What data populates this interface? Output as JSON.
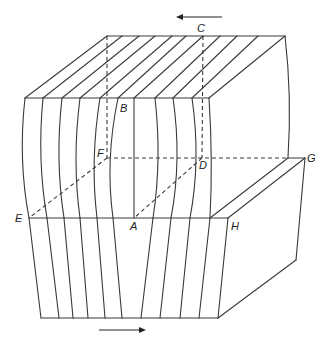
{
  "figure": {
    "type": "block-diagram-shear",
    "labels": [
      {
        "id": "A",
        "text": "A",
        "x": 130,
        "y": 230
      },
      {
        "id": "B",
        "text": "B",
        "x": 120,
        "y": 112
      },
      {
        "id": "C",
        "text": "C",
        "x": 197,
        "y": 32
      },
      {
        "id": "D",
        "text": "D",
        "x": 199,
        "y": 169
      },
      {
        "id": "E",
        "text": "E",
        "x": 15,
        "y": 222
      },
      {
        "id": "F",
        "text": "F",
        "x": 97,
        "y": 157
      },
      {
        "id": "G",
        "text": "G",
        "x": 307,
        "y": 162
      },
      {
        "id": "H",
        "text": "H",
        "x": 231,
        "y": 230
      }
    ],
    "arrows": [
      {
        "name": "top-shear-arrow",
        "direction": "left",
        "x1": 222,
        "y1": 17,
        "x2": 176,
        "y2": 17
      },
      {
        "name": "bottom-shear-arrow",
        "direction": "right",
        "x1": 99,
        "y1": 330,
        "x2": 146,
        "y2": 330
      }
    ],
    "top_face": {
      "back_edge": {
        "x1": 107,
        "y1": 36,
        "x2": 285,
        "y2": 36
      },
      "front_edge": {
        "x1": 25,
        "y1": 98,
        "x2": 209,
        "y2": 98
      },
      "stripe_back_x": [
        107,
        122,
        139,
        155,
        172,
        186,
        220,
        237,
        258
      ],
      "stripe_front_x": [
        25,
        43,
        62,
        80,
        100,
        118,
        155,
        173,
        192
      ]
    },
    "front_upper_verticals": [
      {
        "top": [
          25,
          98
        ],
        "mid": [
          22,
          160
        ],
        "bottom": [
          29,
          218
        ]
      },
      {
        "top": [
          43,
          98
        ],
        "mid": [
          41,
          160
        ],
        "bottom": [
          47,
          218
        ]
      },
      {
        "top": [
          62,
          98
        ],
        "mid": [
          59,
          160
        ],
        "bottom": [
          64,
          218
        ]
      },
      {
        "top": [
          80,
          98
        ],
        "mid": [
          76,
          160
        ],
        "bottom": [
          80,
          218
        ]
      },
      {
        "top": [
          100,
          98
        ],
        "mid": [
          94,
          160
        ],
        "bottom": [
          97,
          218
        ]
      },
      {
        "top": [
          118,
          98
        ],
        "mid": [
          110,
          160
        ],
        "bottom": [
          113,
          218
        ]
      },
      {
        "top": [
          134,
          98
        ],
        "mid": [
          134,
          160
        ],
        "bottom": [
          134,
          218
        ]
      },
      {
        "top": [
          155,
          98
        ],
        "mid": [
          158,
          160
        ],
        "bottom": [
          153,
          218
        ]
      },
      {
        "top": [
          173,
          98
        ],
        "mid": [
          177,
          160
        ],
        "bottom": [
          171,
          218
        ]
      },
      {
        "top": [
          192,
          98
        ],
        "mid": [
          196,
          160
        ],
        "bottom": [
          190,
          218
        ]
      },
      {
        "top": [
          209,
          98
        ],
        "mid": [
          211,
          160
        ],
        "bottom": [
          210,
          218
        ]
      }
    ],
    "front_lower_verticals": [
      {
        "top": [
          29,
          218
        ],
        "bottom": [
          41,
          318
        ]
      },
      {
        "top": [
          47,
          218
        ],
        "bottom": [
          59,
          318
        ]
      },
      {
        "top": [
          64,
          218
        ],
        "bottom": [
          73,
          318
        ]
      },
      {
        "top": [
          80,
          218
        ],
        "bottom": [
          88,
          318
        ]
      },
      {
        "top": [
          97,
          218
        ],
        "bottom": [
          105,
          318
        ]
      },
      {
        "top": [
          113,
          218
        ],
        "bottom": [
          122,
          318
        ]
      },
      {
        "top": [
          153,
          218
        ],
        "bottom": [
          141,
          318
        ]
      },
      {
        "top": [
          171,
          218
        ],
        "bottom": [
          160,
          318
        ]
      },
      {
        "top": [
          190,
          218
        ],
        "bottom": [
          180,
          318
        ]
      },
      {
        "top": [
          210,
          218
        ],
        "bottom": [
          199,
          318
        ]
      },
      {
        "top": [
          228,
          218
        ],
        "bottom": [
          218,
          318
        ]
      }
    ]
  }
}
